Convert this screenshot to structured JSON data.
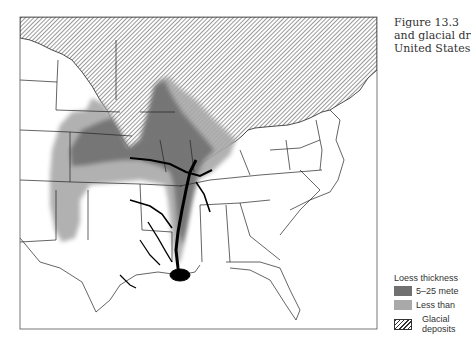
{
  "caption": {
    "lines": [
      "Figure 13.3",
      "and glacial dr",
      "United States"
    ]
  },
  "legend": {
    "title": "Loess thickness",
    "items": [
      {
        "label": "5–25 mete",
        "pattern": "dark-grey",
        "color": "#707070"
      },
      {
        "label": "Less than",
        "pattern": "light-grey",
        "color": "#a9a9a9"
      },
      {
        "label_lines": [
          "Glacial",
          "deposits"
        ],
        "pattern": "hatched"
      }
    ]
  },
  "map": {
    "region": "Central and eastern United States",
    "features": [
      "state-boundaries",
      "glacial-deposits-hatched",
      "loess-thick",
      "loess-thin",
      "mississippi-river-system"
    ]
  }
}
